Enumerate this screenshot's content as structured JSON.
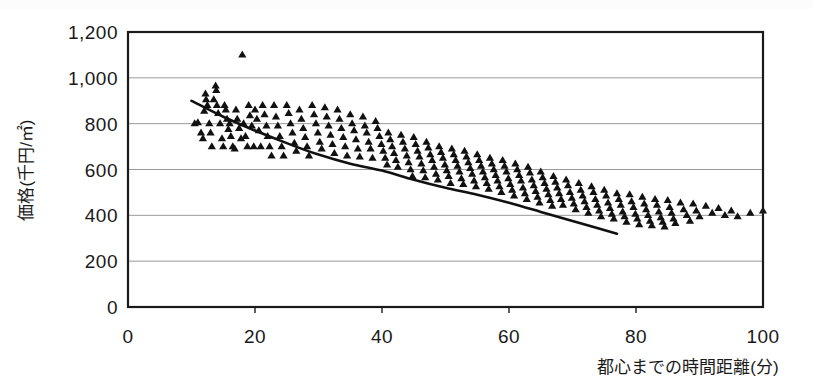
{
  "figure": {
    "title": "",
    "background_color": "#ffffff",
    "ink_color": "#1a1a1a",
    "gridline_color": "#9a9a9a",
    "marker_color": "#111111",
    "trendline_color": "#111111"
  },
  "axes": {
    "y_axis_title": "価格(千円/㎡)",
    "x_axis_title": "都心までの時間距離(分)",
    "y_ticks": [
      "0",
      "200",
      "400",
      "600",
      "800",
      "1,000",
      "1,200"
    ],
    "x_ticks": [
      "0",
      "20",
      "40",
      "60",
      "80",
      "100"
    ]
  },
  "chart_data": {
    "type": "scatter",
    "title": "",
    "xlabel": "都心までの時間距離(分)",
    "ylabel": "価格(千円/㎡)",
    "xlim": [
      0,
      100
    ],
    "ylim": [
      0,
      1200
    ],
    "xtick_values": [
      0,
      20,
      40,
      60,
      80,
      100
    ],
    "ytick_values": [
      0,
      200,
      400,
      600,
      800,
      1000,
      1200
    ],
    "grid": "horizontal",
    "legend": "none",
    "marker": "filled-triangle",
    "series": [
      {
        "name": "物件",
        "marker": "triangle",
        "points": [
          [
            10.5,
            800
          ],
          [
            11.0,
            805
          ],
          [
            11.5,
            760
          ],
          [
            11.8,
            735
          ],
          [
            12.0,
            855
          ],
          [
            12.2,
            930
          ],
          [
            12.3,
            905
          ],
          [
            12.5,
            880
          ],
          [
            12.8,
            800
          ],
          [
            13.0,
            760
          ],
          [
            13.2,
            700
          ],
          [
            13.5,
            905
          ],
          [
            13.8,
            965
          ],
          [
            13.9,
            945
          ],
          [
            14.0,
            880
          ],
          [
            14.2,
            845
          ],
          [
            14.5,
            800
          ],
          [
            14.8,
            735
          ],
          [
            15.0,
            700
          ],
          [
            15.2,
            880
          ],
          [
            15.4,
            860
          ],
          [
            15.6,
            820
          ],
          [
            15.8,
            775
          ],
          [
            16.0,
            800
          ],
          [
            16.2,
            745
          ],
          [
            16.5,
            700
          ],
          [
            16.8,
            690
          ],
          [
            17.0,
            860
          ],
          [
            17.2,
            820
          ],
          [
            17.5,
            780
          ],
          [
            17.8,
            735
          ],
          [
            18.0,
            1100
          ],
          [
            18.2,
            800
          ],
          [
            18.5,
            745
          ],
          [
            18.8,
            700
          ],
          [
            19.0,
            880
          ],
          [
            19.2,
            835
          ],
          [
            19.5,
            790
          ],
          [
            19.8,
            700
          ],
          [
            20.0,
            860
          ],
          [
            20.3,
            820
          ],
          [
            20.6,
            770
          ],
          [
            20.9,
            700
          ],
          [
            21.2,
            880
          ],
          [
            21.5,
            840
          ],
          [
            21.8,
            790
          ],
          [
            22.0,
            745
          ],
          [
            22.3,
            700
          ],
          [
            22.6,
            660
          ],
          [
            23.0,
            880
          ],
          [
            23.3,
            830
          ],
          [
            23.6,
            790
          ],
          [
            23.9,
            745
          ],
          [
            24.2,
            700
          ],
          [
            24.5,
            660
          ],
          [
            25.0,
            880
          ],
          [
            25.3,
            845
          ],
          [
            25.6,
            800
          ],
          [
            25.9,
            760
          ],
          [
            26.2,
            715
          ],
          [
            26.5,
            680
          ],
          [
            27.0,
            860
          ],
          [
            27.3,
            820
          ],
          [
            27.6,
            780
          ],
          [
            27.9,
            740
          ],
          [
            28.2,
            700
          ],
          [
            28.5,
            660
          ],
          [
            29.0,
            880
          ],
          [
            29.3,
            840
          ],
          [
            29.6,
            800
          ],
          [
            29.9,
            760
          ],
          [
            30.2,
            720
          ],
          [
            30.5,
            690
          ],
          [
            31.0,
            870
          ],
          [
            31.3,
            830
          ],
          [
            31.6,
            790
          ],
          [
            31.9,
            750
          ],
          [
            32.2,
            710
          ],
          [
            32.5,
            670
          ],
          [
            33.0,
            860
          ],
          [
            33.3,
            820
          ],
          [
            33.6,
            780
          ],
          [
            33.9,
            740
          ],
          [
            34.2,
            700
          ],
          [
            34.5,
            660
          ],
          [
            35.0,
            840
          ],
          [
            35.3,
            800
          ],
          [
            35.6,
            770
          ],
          [
            35.9,
            730
          ],
          [
            36.2,
            690
          ],
          [
            36.5,
            655
          ],
          [
            37.0,
            830
          ],
          [
            37.3,
            790
          ],
          [
            37.6,
            760
          ],
          [
            37.9,
            720
          ],
          [
            38.2,
            690
          ],
          [
            38.5,
            650
          ],
          [
            39.0,
            810
          ],
          [
            39.3,
            780
          ],
          [
            39.6,
            745
          ],
          [
            39.9,
            710
          ],
          [
            40.2,
            680
          ],
          [
            40.5,
            650
          ],
          [
            40.8,
            620
          ],
          [
            41.0,
            760
          ],
          [
            41.3,
            730
          ],
          [
            41.6,
            700
          ],
          [
            41.9,
            670
          ],
          [
            42.2,
            640
          ],
          [
            42.5,
            610
          ],
          [
            43.0,
            750
          ],
          [
            43.3,
            720
          ],
          [
            43.6,
            690
          ],
          [
            43.9,
            660
          ],
          [
            44.2,
            630
          ],
          [
            44.5,
            600
          ],
          [
            44.8,
            570
          ],
          [
            45.0,
            740
          ],
          [
            45.3,
            710
          ],
          [
            45.6,
            680
          ],
          [
            45.9,
            655
          ],
          [
            46.2,
            625
          ],
          [
            46.5,
            595
          ],
          [
            46.8,
            565
          ],
          [
            47.0,
            720
          ],
          [
            47.3,
            695
          ],
          [
            47.6,
            665
          ],
          [
            47.9,
            640
          ],
          [
            48.2,
            610
          ],
          [
            48.5,
            580
          ],
          [
            48.8,
            555
          ],
          [
            49.0,
            700
          ],
          [
            49.3,
            675
          ],
          [
            49.6,
            650
          ],
          [
            49.9,
            620
          ],
          [
            50.2,
            595
          ],
          [
            50.5,
            570
          ],
          [
            50.8,
            540
          ],
          [
            51.0,
            690
          ],
          [
            51.3,
            665
          ],
          [
            51.6,
            640
          ],
          [
            51.9,
            615
          ],
          [
            52.2,
            590
          ],
          [
            52.5,
            560
          ],
          [
            52.8,
            535
          ],
          [
            53.0,
            680
          ],
          [
            53.3,
            655
          ],
          [
            53.6,
            630
          ],
          [
            53.9,
            605
          ],
          [
            54.2,
            580
          ],
          [
            54.5,
            550
          ],
          [
            54.8,
            525
          ],
          [
            55.0,
            665
          ],
          [
            55.3,
            640
          ],
          [
            55.6,
            615
          ],
          [
            55.9,
            590
          ],
          [
            56.2,
            565
          ],
          [
            56.5,
            540
          ],
          [
            56.8,
            515
          ],
          [
            57.0,
            650
          ],
          [
            57.3,
            625
          ],
          [
            57.6,
            600
          ],
          [
            57.9,
            575
          ],
          [
            58.2,
            550
          ],
          [
            58.5,
            525
          ],
          [
            58.8,
            500
          ],
          [
            59.0,
            640
          ],
          [
            59.3,
            615
          ],
          [
            59.6,
            590
          ],
          [
            59.9,
            560
          ],
          [
            60.2,
            535
          ],
          [
            60.5,
            510
          ],
          [
            60.8,
            485
          ],
          [
            61.0,
            625
          ],
          [
            61.3,
            600
          ],
          [
            61.6,
            575
          ],
          [
            61.9,
            550
          ],
          [
            62.2,
            520
          ],
          [
            62.5,
            495
          ],
          [
            62.8,
            470
          ],
          [
            63.0,
            610
          ],
          [
            63.3,
            585
          ],
          [
            63.6,
            555
          ],
          [
            63.9,
            530
          ],
          [
            64.2,
            505
          ],
          [
            64.5,
            480
          ],
          [
            64.8,
            455
          ],
          [
            65.0,
            590
          ],
          [
            65.3,
            565
          ],
          [
            65.6,
            540
          ],
          [
            65.9,
            515
          ],
          [
            66.2,
            490
          ],
          [
            66.5,
            465
          ],
          [
            66.8,
            440
          ],
          [
            67.0,
            570
          ],
          [
            67.3,
            545
          ],
          [
            67.6,
            520
          ],
          [
            67.9,
            495
          ],
          [
            68.2,
            470
          ],
          [
            68.5,
            445
          ],
          [
            69.0,
            555
          ],
          [
            69.3,
            530
          ],
          [
            69.6,
            500
          ],
          [
            69.9,
            475
          ],
          [
            70.2,
            450
          ],
          [
            70.5,
            425
          ],
          [
            71.0,
            540
          ],
          [
            71.3,
            510
          ],
          [
            71.6,
            485
          ],
          [
            71.9,
            460
          ],
          [
            72.2,
            435
          ],
          [
            72.5,
            410
          ],
          [
            73.0,
            525
          ],
          [
            73.3,
            500
          ],
          [
            73.6,
            470
          ],
          [
            73.9,
            445
          ],
          [
            74.2,
            420
          ],
          [
            74.5,
            395
          ],
          [
            75.0,
            510
          ],
          [
            75.3,
            485
          ],
          [
            75.6,
            455
          ],
          [
            75.9,
            430
          ],
          [
            76.2,
            405
          ],
          [
            76.5,
            385
          ],
          [
            77.0,
            495
          ],
          [
            77.3,
            470
          ],
          [
            77.6,
            445
          ],
          [
            77.9,
            415
          ],
          [
            78.2,
            395
          ],
          [
            78.5,
            370
          ],
          [
            79.0,
            490
          ],
          [
            79.3,
            460
          ],
          [
            79.6,
            435
          ],
          [
            79.9,
            405
          ],
          [
            80.2,
            385
          ],
          [
            80.5,
            360
          ],
          [
            81.0,
            480
          ],
          [
            81.3,
            450
          ],
          [
            81.6,
            425
          ],
          [
            81.9,
            400
          ],
          [
            82.2,
            375
          ],
          [
            82.5,
            355
          ],
          [
            83.0,
            470
          ],
          [
            83.3,
            445
          ],
          [
            83.6,
            415
          ],
          [
            83.9,
            390
          ],
          [
            84.2,
            370
          ],
          [
            84.5,
            350
          ],
          [
            85.0,
            465
          ],
          [
            85.3,
            435
          ],
          [
            85.6,
            410
          ],
          [
            85.9,
            385
          ],
          [
            86.2,
            365
          ],
          [
            87.0,
            455
          ],
          [
            87.5,
            425
          ],
          [
            88.0,
            400
          ],
          [
            88.5,
            375
          ],
          [
            89.0,
            450
          ],
          [
            89.5,
            420
          ],
          [
            90.0,
            395
          ],
          [
            91.0,
            440
          ],
          [
            92.0,
            410
          ],
          [
            93.0,
            430
          ],
          [
            94.0,
            400
          ],
          [
            95.0,
            420
          ],
          [
            96.0,
            395
          ],
          [
            98.0,
            410
          ],
          [
            100.0,
            420
          ],
          [
            102.0,
            400
          ],
          [
            105.0,
            415
          ],
          [
            108.0,
            395
          ],
          [
            112.0,
            370
          ],
          [
            118.0,
            350
          ],
          [
            125.0,
            345
          ],
          [
            132.0,
            330
          ],
          [
            140.0,
            320
          ]
        ]
      }
    ],
    "trendline": {
      "type": "polynomial",
      "description": "downward sloping fitted curve",
      "points": [
        [
          10,
          900
        ],
        [
          15,
          830
        ],
        [
          20,
          770
        ],
        [
          25,
          715
        ],
        [
          30,
          665
        ],
        [
          35,
          625
        ],
        [
          40,
          595
        ],
        [
          45,
          555
        ],
        [
          50,
          520
        ],
        [
          55,
          490
        ],
        [
          60,
          455
        ],
        [
          65,
          415
        ],
        [
          70,
          375
        ],
        [
          77,
          320
        ]
      ]
    }
  }
}
